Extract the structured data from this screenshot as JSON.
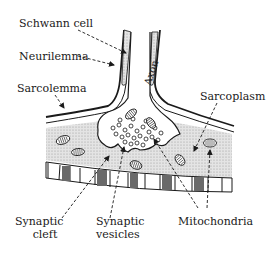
{
  "diagram": {
    "colors": {
      "ink": "#1a1a1a",
      "stipple": "#d6d6d6",
      "background": "#ffffff"
    },
    "labels": {
      "schwann_cell": "Schwann cell",
      "neurilemma": "Neurilemma",
      "sarcolemma": "Sarcolemma",
      "axon": "Axon",
      "sarcoplasm": "Sarcoplasm",
      "synaptic_cleft_line1": "Synaptic",
      "synaptic_cleft_line2": "cleft",
      "synaptic_vesicles_line1": "Synaptic",
      "synaptic_vesicles_line2": "vesicles",
      "mitochondria": "Mitochondria"
    }
  }
}
